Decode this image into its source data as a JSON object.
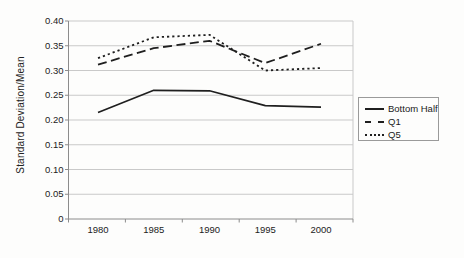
{
  "figure": {
    "background": "#fdfdfc"
  },
  "chart_data": {
    "type": "line",
    "title": "",
    "xlabel": "",
    "ylabel": "Standard Deviation/Mean",
    "categories": [
      "1980",
      "1985",
      "1990",
      "1995",
      "2000"
    ],
    "series": [
      {
        "name": "Bottom Half",
        "style": "solid",
        "values": [
          0.215,
          0.26,
          0.259,
          0.229,
          0.226
        ]
      },
      {
        "name": "Q1",
        "style": "dashed",
        "values": [
          0.312,
          0.345,
          0.36,
          0.315,
          0.354
        ]
      },
      {
        "name": "Q5",
        "style": "dotted",
        "values": [
          0.325,
          0.367,
          0.372,
          0.3,
          0.305
        ]
      }
    ],
    "ylim": [
      0,
      0.4
    ],
    "y_tick_step": 0.05,
    "y_tick_labels": [
      "0",
      "0.05",
      "0.10",
      "0.15",
      "0.20",
      "0.25",
      "0.30",
      "0.35",
      "0.40"
    ],
    "grid": "horizontal",
    "legend_position": "right",
    "colors": {
      "line": "#1f1f1f",
      "grid": "#c9c9c9",
      "axis": "#8c8c8c",
      "text": "#222222"
    }
  }
}
